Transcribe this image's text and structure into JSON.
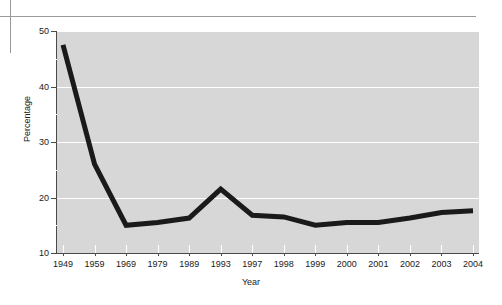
{
  "decorations": {
    "vertical_rule": "page-crop-rule-vertical",
    "horizontal_rule": "page-crop-rule-horizontal"
  },
  "chart_data": {
    "type": "line",
    "title": "",
    "xlabel": "Year",
    "ylabel": "Percentage",
    "categories": [
      "1949",
      "1959",
      "1969",
      "1979",
      "1989",
      "1993",
      "1997",
      "1998",
      "1999",
      "2000",
      "2001",
      "2002",
      "2003",
      "2004"
    ],
    "values": [
      47.5,
      26.0,
      15.0,
      15.5,
      16.3,
      21.5,
      16.8,
      16.5,
      15.0,
      15.5,
      15.5,
      16.3,
      17.3,
      17.6
    ],
    "ylim": [
      10,
      50
    ],
    "y_major_ticks": [
      10,
      20,
      30,
      40,
      50
    ],
    "y_minor_ticks": [
      15,
      25,
      35,
      45
    ],
    "y_tick_labels": [
      "10",
      "20",
      "30",
      "40",
      "50"
    ],
    "gridlines": "horizontal-white",
    "grid": true,
    "legend": "none",
    "series_color": "#1a1a1a",
    "plot_background": "#d7d7d7",
    "line_width_px": 5
  }
}
